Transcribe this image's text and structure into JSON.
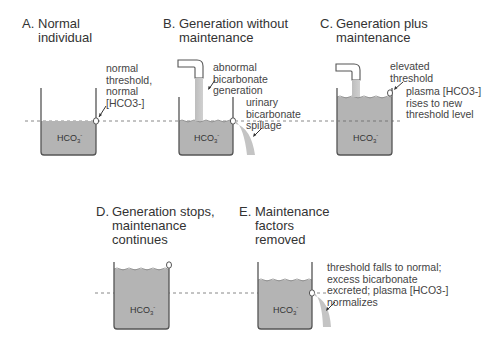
{
  "panels": [
    {
      "letter": "A.",
      "title_lines": [
        "Normal",
        "individual"
      ],
      "fluid_label": "HCO3-",
      "annotations": [
        {
          "text": "normal\nthreshold,\nnormal\n[HCO3-]"
        }
      ]
    },
    {
      "letter": "B.",
      "title_lines": [
        "Generation without",
        "maintenance"
      ],
      "fluid_label": "HCO3-",
      "annotations": [
        {
          "text": "abnormal\nbicarbonate\ngeneration"
        },
        {
          "text": "urinary\nbicarbonate\nspillage"
        }
      ]
    },
    {
      "letter": "C.",
      "title_lines": [
        "Generation plus",
        "maintenance"
      ],
      "fluid_label": "HCO3-",
      "annotations": [
        {
          "text": "elevated\nthreshold"
        },
        {
          "text": "plasma [HCO3-]\nrises to new\nthreshold level"
        }
      ]
    },
    {
      "letter": "D.",
      "title_lines": [
        "Generation stops,",
        "maintenance",
        "continues"
      ],
      "fluid_label": "HCO3-",
      "annotations": []
    },
    {
      "letter": "E.",
      "title_lines": [
        "Maintenance",
        "factors",
        "removed"
      ],
      "fluid_label": "HCO3-",
      "annotations": [
        {
          "text": "threshold falls to normal;\nexcess bicarbonate\nexcreted; plasma [HCO3-]\nnormalizes"
        }
      ]
    }
  ],
  "colors": {
    "fluid": "#b4b4b4",
    "fluid_edge": "#8a8a8a",
    "vessel": "#555555",
    "dashed": "#888888",
    "text": "#3a3a3a"
  }
}
